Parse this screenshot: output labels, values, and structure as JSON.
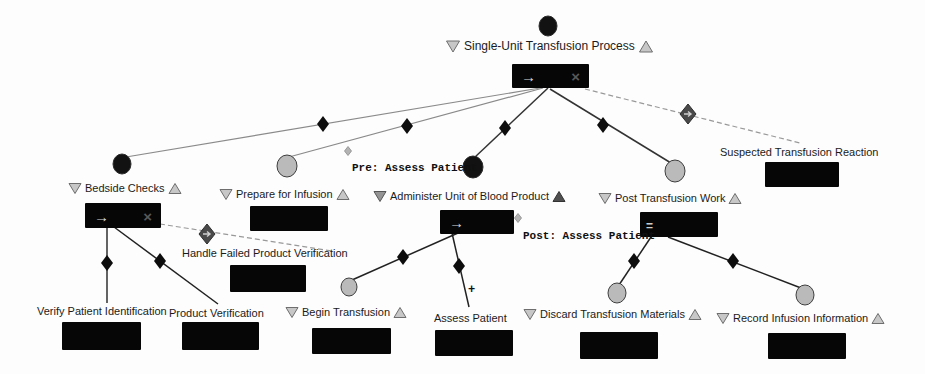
{
  "steps": {
    "root": {
      "label": "Single-Unit Transfusion Process"
    },
    "bedside_checks": {
      "label": "Bedside Checks"
    },
    "prepare_for_infusion": {
      "label": "Prepare for Infusion"
    },
    "administer_unit": {
      "label": "Administer Unit of Blood Product"
    },
    "post_transfusion_work": {
      "label": "Post Transfusion Work"
    },
    "suspected_reaction": {
      "label": "Suspected Transfusion Reaction"
    },
    "handle_failed_verification": {
      "label": "Handle Failed Product Verification"
    },
    "verify_patient_id": {
      "label": "Verify Patient Identification"
    },
    "product_verification": {
      "label": "Product Verification"
    },
    "begin_transfusion": {
      "label": "Begin Transfusion"
    },
    "assess_patient": {
      "label": "Assess Patient"
    },
    "discard_materials": {
      "label": "Discard Transfusion Materials"
    },
    "record_infusion_info": {
      "label": "Record Infusion Information"
    }
  },
  "annotations": {
    "pre_assess": "Pre: Assess Patient",
    "post_assess": "Post: Assess Patient",
    "cardinality_plus": "+"
  },
  "badges": {
    "sequential_arrow": "→",
    "handler_x": "×",
    "parallel_equals": "="
  },
  "colors": {
    "bar": "#060606",
    "triangle_light": "#c7c7c7",
    "triangle_mid": "#949494",
    "triangle_dark": "#4f4f4f",
    "circle_black": "#121212",
    "circle_gray": "#bababa",
    "edge_dark": "#333333",
    "edge_light": "#8a8a8a",
    "handler_edge": "#999999",
    "diamond": "#0d0d0d"
  }
}
